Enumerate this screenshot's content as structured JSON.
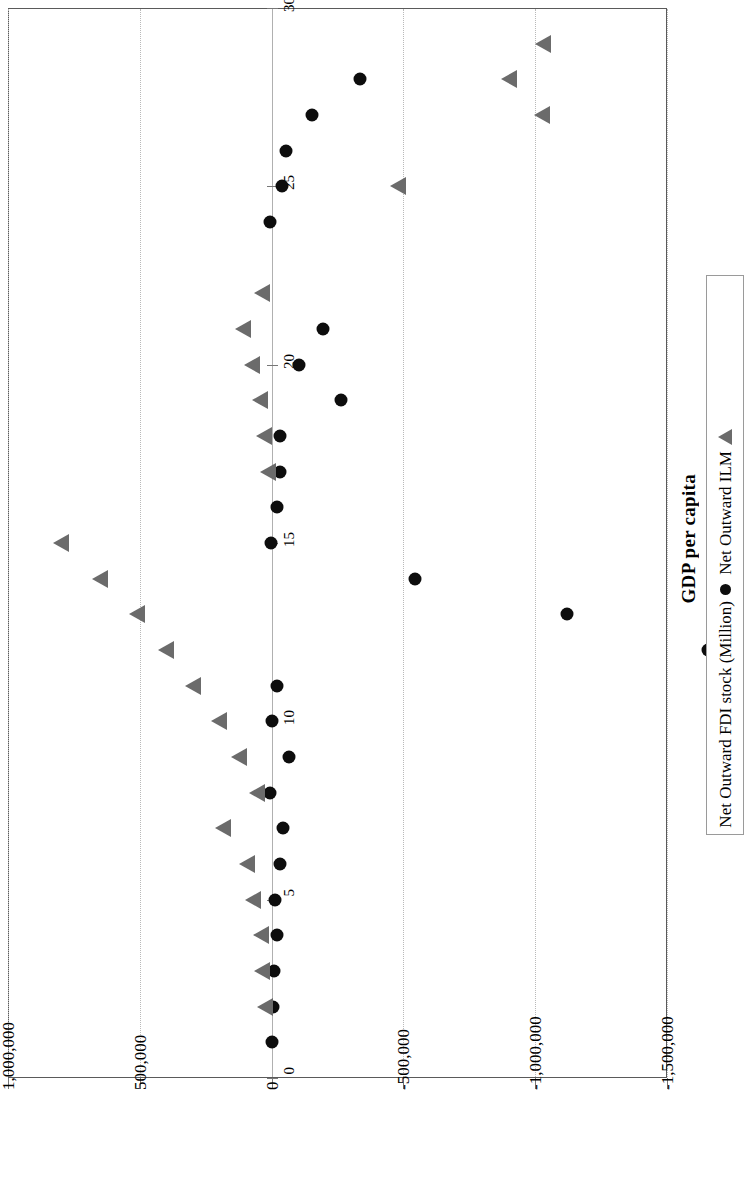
{
  "chart": {
    "axis_title": "GDP per capita",
    "legend": {
      "entries": [
        {
          "label": "Net Outward FDI stock (Million)",
          "marker": "circle-marker",
          "color": "#0d0d0d"
        },
        {
          "label": "Net Outward ILM",
          "marker": "triangle-marker",
          "color": "#6b6b6b"
        }
      ]
    }
  },
  "chart_data": {
    "type": "scatter",
    "title": "",
    "orientation": "rotated-90-clockwise",
    "xlabel": "GDP per capita",
    "ylabel": "",
    "xlim": [
      0,
      30
    ],
    "ylim": [
      -1500000,
      1000000
    ],
    "xticks": [
      0,
      5,
      10,
      15,
      20,
      25,
      30
    ],
    "xtick_labels": [
      "0",
      "5",
      "10",
      "15",
      "20",
      "25",
      "30"
    ],
    "yticks": [
      1000000,
      500000,
      0,
      -500000,
      -1000000,
      -1500000
    ],
    "ytick_labels": [
      "1,000,000",
      "500,000",
      "0",
      "-500,000",
      "-1,000,000",
      "-1,500,000"
    ],
    "grid": true,
    "legend_position": "right",
    "series": [
      {
        "name": "Net Outward FDI stock (Million)",
        "marker": "circle",
        "color": "#0d0d0d",
        "points": [
          {
            "x": 1,
            "y": 0
          },
          {
            "x": 2,
            "y": -5000
          },
          {
            "x": 3,
            "y": -8000
          },
          {
            "x": 4,
            "y": -22000
          },
          {
            "x": 5,
            "y": -14000
          },
          {
            "x": 6,
            "y": -30000
          },
          {
            "x": 7,
            "y": -45000
          },
          {
            "x": 8,
            "y": 5000
          },
          {
            "x": 9,
            "y": -65000
          },
          {
            "x": 10,
            "y": -2000
          },
          {
            "x": 11,
            "y": -22000
          },
          {
            "x": 12,
            "y": -1655000
          },
          {
            "x": 13,
            "y": -1120000
          },
          {
            "x": 14,
            "y": -545000
          },
          {
            "x": 15,
            "y": 3000
          },
          {
            "x": 16,
            "y": -22000
          },
          {
            "x": 17,
            "y": -30000
          },
          {
            "x": 18,
            "y": -30000
          },
          {
            "x": 19,
            "y": -265000
          },
          {
            "x": 20,
            "y": -105000
          },
          {
            "x": 21,
            "y": -195000
          },
          {
            "x": 24,
            "y": 5000
          },
          {
            "x": 25,
            "y": -38000
          },
          {
            "x": 26,
            "y": -55000
          },
          {
            "x": 27,
            "y": -155000
          },
          {
            "x": 28,
            "y": -335000
          }
        ]
      },
      {
        "name": "Net Outward ILM",
        "marker": "triangle",
        "color": "#6b6b6b",
        "points": [
          {
            "x": 2,
            "y": 25000
          },
          {
            "x": 3,
            "y": 35000
          },
          {
            "x": 4,
            "y": 42000
          },
          {
            "x": 5,
            "y": 70000
          },
          {
            "x": 6,
            "y": 95000
          },
          {
            "x": 7,
            "y": 185000
          },
          {
            "x": 8,
            "y": 55000
          },
          {
            "x": 9,
            "y": 125000
          },
          {
            "x": 10,
            "y": 200000
          },
          {
            "x": 11,
            "y": 300000
          },
          {
            "x": 12,
            "y": 400000
          },
          {
            "x": 13,
            "y": 510000
          },
          {
            "x": 14,
            "y": 650000
          },
          {
            "x": 15,
            "y": 800000
          },
          {
            "x": 17,
            "y": 15000
          },
          {
            "x": 18,
            "y": 30000
          },
          {
            "x": 19,
            "y": 45000
          },
          {
            "x": 20,
            "y": 75000
          },
          {
            "x": 21,
            "y": 110000
          },
          {
            "x": 22,
            "y": 35000
          },
          {
            "x": 25,
            "y": -480000
          },
          {
            "x": 27,
            "y": -1025000
          },
          {
            "x": 28,
            "y": -900000
          },
          {
            "x": 29,
            "y": -1030000
          }
        ]
      }
    ]
  }
}
